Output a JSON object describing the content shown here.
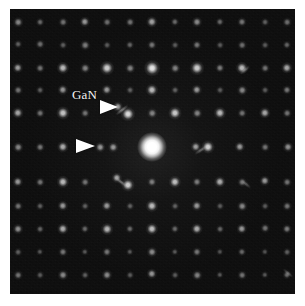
{
  "figure": {
    "type": "electron-diffraction-pattern",
    "modality": "TEM selected-area electron diffraction",
    "panel": {
      "x": 10,
      "y": 9,
      "width": 285,
      "height": 285,
      "background_color": "#0a0a0a",
      "page_background_color": "#ffffff"
    },
    "annotations": {
      "label_text": "GaN",
      "label_color": "#f4f4f4",
      "label_x": 72,
      "label_y": 88,
      "label_font_size": 13,
      "arrow_color": "#ffffff",
      "arrows": [
        {
          "name": "upper-arrowhead",
          "x": 100,
          "y": 100,
          "width": 18,
          "half_height": 7,
          "direction": "right"
        },
        {
          "name": "lower-arrowhead",
          "x": 76,
          "y": 139,
          "width": 19,
          "half_height": 7,
          "direction": "right"
        }
      ]
    },
    "direct_beam": {
      "name": "central-transmitted-beam",
      "cx": 152,
      "cy": 147,
      "diameter": 30,
      "intensity": 1.0
    },
    "lattice": {
      "description": "square-ish reciprocal lattice of diffraction maxima with superlattice satellites",
      "a_spacing_px": 22.5,
      "b_spacing_px": 24.5,
      "origin_x": 152,
      "origin_y": 147
    },
    "spots": [
      {
        "cx": 18,
        "cy": 22,
        "r": 2.4,
        "i": 0.5
      },
      {
        "cx": 40,
        "cy": 22,
        "r": 2.0,
        "i": 0.38
      },
      {
        "cx": 63,
        "cy": 22,
        "r": 2.2,
        "i": 0.42
      },
      {
        "cx": 85,
        "cy": 22,
        "r": 2.6,
        "i": 0.58
      },
      {
        "cx": 107,
        "cy": 22,
        "r": 2.2,
        "i": 0.4
      },
      {
        "cx": 130,
        "cy": 22,
        "r": 2.2,
        "i": 0.42
      },
      {
        "cx": 152,
        "cy": 22,
        "r": 2.8,
        "i": 0.62
      },
      {
        "cx": 175,
        "cy": 22,
        "r": 2.1,
        "i": 0.38
      },
      {
        "cx": 197,
        "cy": 22,
        "r": 2.5,
        "i": 0.52
      },
      {
        "cx": 220,
        "cy": 22,
        "r": 2.1,
        "i": 0.38
      },
      {
        "cx": 242,
        "cy": 22,
        "r": 2.3,
        "i": 0.44
      },
      {
        "cx": 265,
        "cy": 22,
        "r": 2.0,
        "i": 0.34
      },
      {
        "cx": 287,
        "cy": 22,
        "r": 2.2,
        "i": 0.4
      },
      {
        "cx": 18,
        "cy": 44,
        "r": 2.0,
        "i": 0.34
      },
      {
        "cx": 40,
        "cy": 44,
        "r": 2.2,
        "i": 0.4
      },
      {
        "cx": 63,
        "cy": 45,
        "r": 2.0,
        "i": 0.34
      },
      {
        "cx": 85,
        "cy": 45,
        "r": 2.4,
        "i": 0.46
      },
      {
        "cx": 107,
        "cy": 45,
        "r": 2.0,
        "i": 0.32
      },
      {
        "cx": 130,
        "cy": 45,
        "r": 2.1,
        "i": 0.36
      },
      {
        "cx": 152,
        "cy": 45,
        "r": 2.3,
        "i": 0.44
      },
      {
        "cx": 175,
        "cy": 45,
        "r": 2.0,
        "i": 0.32
      },
      {
        "cx": 197,
        "cy": 45,
        "r": 2.3,
        "i": 0.44
      },
      {
        "cx": 220,
        "cy": 45,
        "r": 2.0,
        "i": 0.32
      },
      {
        "cx": 242,
        "cy": 45,
        "r": 2.2,
        "i": 0.4
      },
      {
        "cx": 265,
        "cy": 45,
        "r": 2.0,
        "i": 0.32
      },
      {
        "cx": 287,
        "cy": 45,
        "r": 2.1,
        "i": 0.36
      },
      {
        "cx": 18,
        "cy": 68,
        "r": 2.6,
        "i": 0.6
      },
      {
        "cx": 40,
        "cy": 68,
        "r": 2.2,
        "i": 0.42
      },
      {
        "cx": 63,
        "cy": 68,
        "r": 3.0,
        "i": 0.72
      },
      {
        "cx": 85,
        "cy": 68,
        "r": 2.4,
        "i": 0.48
      },
      {
        "cx": 107,
        "cy": 68,
        "r": 3.4,
        "i": 0.8
      },
      {
        "cx": 130,
        "cy": 68,
        "r": 2.4,
        "i": 0.48
      },
      {
        "cx": 152,
        "cy": 68,
        "r": 3.8,
        "i": 0.9
      },
      {
        "cx": 175,
        "cy": 68,
        "r": 2.4,
        "i": 0.48
      },
      {
        "cx": 197,
        "cy": 68,
        "r": 3.4,
        "i": 0.8
      },
      {
        "cx": 220,
        "cy": 68,
        "r": 2.3,
        "i": 0.46
      },
      {
        "cx": 242,
        "cy": 68,
        "r": 3.0,
        "i": 0.72
      },
      {
        "cx": 265,
        "cy": 68,
        "r": 2.2,
        "i": 0.42
      },
      {
        "cx": 287,
        "cy": 68,
        "r": 2.8,
        "i": 0.64
      },
      {
        "cx": 18,
        "cy": 90,
        "r": 2.2,
        "i": 0.42
      },
      {
        "cx": 40,
        "cy": 90,
        "r": 2.0,
        "i": 0.34
      },
      {
        "cx": 63,
        "cy": 90,
        "r": 2.6,
        "i": 0.56
      },
      {
        "cx": 107,
        "cy": 90,
        "r": 2.6,
        "i": 0.58
      },
      {
        "cx": 130,
        "cy": 90,
        "r": 2.0,
        "i": 0.34
      },
      {
        "cx": 152,
        "cy": 90,
        "r": 3.0,
        "i": 0.72
      },
      {
        "cx": 175,
        "cy": 90,
        "r": 2.0,
        "i": 0.34
      },
      {
        "cx": 197,
        "cy": 90,
        "r": 2.6,
        "i": 0.58
      },
      {
        "cx": 220,
        "cy": 90,
        "r": 2.0,
        "i": 0.32
      },
      {
        "cx": 242,
        "cy": 90,
        "r": 2.4,
        "i": 0.5
      },
      {
        "cx": 265,
        "cy": 90,
        "r": 2.0,
        "i": 0.32
      },
      {
        "cx": 287,
        "cy": 90,
        "r": 2.3,
        "i": 0.44
      },
      {
        "cx": 18,
        "cy": 113,
        "r": 2.8,
        "i": 0.64
      },
      {
        "cx": 40,
        "cy": 113,
        "r": 2.2,
        "i": 0.42
      },
      {
        "cx": 63,
        "cy": 113,
        "r": 3.2,
        "i": 0.76
      },
      {
        "cx": 85,
        "cy": 113,
        "r": 2.2,
        "i": 0.42
      },
      {
        "cx": 118,
        "cy": 107,
        "r": 2.6,
        "i": 0.62
      },
      {
        "cx": 128,
        "cy": 114,
        "r": 3.4,
        "i": 0.86
      },
      {
        "cx": 152,
        "cy": 113,
        "r": 2.4,
        "i": 0.48
      },
      {
        "cx": 175,
        "cy": 113,
        "r": 3.2,
        "i": 0.78
      },
      {
        "cx": 197,
        "cy": 113,
        "r": 2.4,
        "i": 0.48
      },
      {
        "cx": 220,
        "cy": 113,
        "r": 3.0,
        "i": 0.72
      },
      {
        "cx": 242,
        "cy": 113,
        "r": 2.2,
        "i": 0.42
      },
      {
        "cx": 265,
        "cy": 113,
        "r": 2.8,
        "i": 0.64
      },
      {
        "cx": 287,
        "cy": 113,
        "r": 2.2,
        "i": 0.42
      },
      {
        "cx": 18,
        "cy": 147,
        "r": 2.4,
        "i": 0.5
      },
      {
        "cx": 40,
        "cy": 147,
        "r": 2.2,
        "i": 0.44
      },
      {
        "cx": 63,
        "cy": 147,
        "r": 2.8,
        "i": 0.66
      },
      {
        "cx": 100,
        "cy": 147,
        "r": 2.4,
        "i": 0.56
      },
      {
        "cx": 113,
        "cy": 147,
        "r": 2.4,
        "i": 0.56
      },
      {
        "cx": 196,
        "cy": 147,
        "r": 2.6,
        "i": 0.6
      },
      {
        "cx": 208,
        "cy": 147,
        "r": 3.2,
        "i": 0.82
      },
      {
        "cx": 240,
        "cy": 147,
        "r": 2.6,
        "i": 0.58
      },
      {
        "cx": 265,
        "cy": 147,
        "r": 2.2,
        "i": 0.42
      },
      {
        "cx": 288,
        "cy": 147,
        "r": 2.5,
        "i": 0.54
      },
      {
        "cx": 18,
        "cy": 182,
        "r": 2.6,
        "i": 0.58
      },
      {
        "cx": 40,
        "cy": 182,
        "r": 2.2,
        "i": 0.42
      },
      {
        "cx": 63,
        "cy": 182,
        "r": 3.0,
        "i": 0.72
      },
      {
        "cx": 85,
        "cy": 182,
        "r": 2.2,
        "i": 0.42
      },
      {
        "cx": 117,
        "cy": 178,
        "r": 2.6,
        "i": 0.62
      },
      {
        "cx": 128,
        "cy": 185,
        "r": 3.2,
        "i": 0.8
      },
      {
        "cx": 152,
        "cy": 182,
        "r": 2.3,
        "i": 0.46
      },
      {
        "cx": 175,
        "cy": 182,
        "r": 3.0,
        "i": 0.74
      },
      {
        "cx": 197,
        "cy": 182,
        "r": 2.3,
        "i": 0.46
      },
      {
        "cx": 220,
        "cy": 182,
        "r": 2.8,
        "i": 0.66
      },
      {
        "cx": 242,
        "cy": 182,
        "r": 2.2,
        "i": 0.42
      },
      {
        "cx": 265,
        "cy": 181,
        "r": 2.6,
        "i": 0.58
      },
      {
        "cx": 287,
        "cy": 182,
        "r": 2.2,
        "i": 0.42
      },
      {
        "cx": 18,
        "cy": 206,
        "r": 2.2,
        "i": 0.42
      },
      {
        "cx": 40,
        "cy": 206,
        "r": 2.0,
        "i": 0.34
      },
      {
        "cx": 63,
        "cy": 206,
        "r": 2.6,
        "i": 0.58
      },
      {
        "cx": 85,
        "cy": 206,
        "r": 2.0,
        "i": 0.34
      },
      {
        "cx": 107,
        "cy": 206,
        "r": 2.6,
        "i": 0.58
      },
      {
        "cx": 130,
        "cy": 206,
        "r": 2.0,
        "i": 0.34
      },
      {
        "cx": 152,
        "cy": 206,
        "r": 3.0,
        "i": 0.72
      },
      {
        "cx": 175,
        "cy": 206,
        "r": 2.0,
        "i": 0.34
      },
      {
        "cx": 197,
        "cy": 206,
        "r": 2.6,
        "i": 0.58
      },
      {
        "cx": 220,
        "cy": 206,
        "r": 2.0,
        "i": 0.32
      },
      {
        "cx": 242,
        "cy": 206,
        "r": 2.4,
        "i": 0.5
      },
      {
        "cx": 265,
        "cy": 206,
        "r": 2.0,
        "i": 0.32
      },
      {
        "cx": 287,
        "cy": 206,
        "r": 2.2,
        "i": 0.42
      },
      {
        "cx": 18,
        "cy": 229,
        "r": 2.5,
        "i": 0.54
      },
      {
        "cx": 40,
        "cy": 229,
        "r": 2.0,
        "i": 0.36
      },
      {
        "cx": 63,
        "cy": 229,
        "r": 2.8,
        "i": 0.66
      },
      {
        "cx": 85,
        "cy": 229,
        "r": 2.1,
        "i": 0.38
      },
      {
        "cx": 107,
        "cy": 229,
        "r": 2.9,
        "i": 0.7
      },
      {
        "cx": 130,
        "cy": 229,
        "r": 2.1,
        "i": 0.38
      },
      {
        "cx": 152,
        "cy": 229,
        "r": 3.0,
        "i": 0.74
      },
      {
        "cx": 175,
        "cy": 229,
        "r": 2.1,
        "i": 0.38
      },
      {
        "cx": 197,
        "cy": 229,
        "r": 2.8,
        "i": 0.66
      },
      {
        "cx": 220,
        "cy": 229,
        "r": 2.0,
        "i": 0.36
      },
      {
        "cx": 242,
        "cy": 229,
        "r": 2.6,
        "i": 0.58
      },
      {
        "cx": 265,
        "cy": 228,
        "r": 2.2,
        "i": 0.42
      },
      {
        "cx": 287,
        "cy": 229,
        "r": 2.3,
        "i": 0.46
      },
      {
        "cx": 18,
        "cy": 252,
        "r": 2.0,
        "i": 0.34
      },
      {
        "cx": 40,
        "cy": 252,
        "r": 1.9,
        "i": 0.3
      },
      {
        "cx": 63,
        "cy": 252,
        "r": 2.3,
        "i": 0.44
      },
      {
        "cx": 85,
        "cy": 252,
        "r": 1.9,
        "i": 0.3
      },
      {
        "cx": 107,
        "cy": 252,
        "r": 2.3,
        "i": 0.44
      },
      {
        "cx": 130,
        "cy": 252,
        "r": 1.9,
        "i": 0.3
      },
      {
        "cx": 152,
        "cy": 252,
        "r": 2.5,
        "i": 0.52
      },
      {
        "cx": 175,
        "cy": 252,
        "r": 1.9,
        "i": 0.3
      },
      {
        "cx": 197,
        "cy": 252,
        "r": 2.3,
        "i": 0.44
      },
      {
        "cx": 220,
        "cy": 252,
        "r": 1.9,
        "i": 0.28
      },
      {
        "cx": 242,
        "cy": 252,
        "r": 2.1,
        "i": 0.38
      },
      {
        "cx": 265,
        "cy": 252,
        "r": 1.9,
        "i": 0.28
      },
      {
        "cx": 287,
        "cy": 252,
        "r": 2.0,
        "i": 0.34
      },
      {
        "cx": 18,
        "cy": 275,
        "r": 2.2,
        "i": 0.42
      },
      {
        "cx": 40,
        "cy": 275,
        "r": 2.0,
        "i": 0.32
      },
      {
        "cx": 63,
        "cy": 275,
        "r": 2.5,
        "i": 0.52
      },
      {
        "cx": 85,
        "cy": 275,
        "r": 2.0,
        "i": 0.34
      },
      {
        "cx": 107,
        "cy": 275,
        "r": 2.5,
        "i": 0.52
      },
      {
        "cx": 130,
        "cy": 275,
        "r": 2.0,
        "i": 0.32
      },
      {
        "cx": 152,
        "cy": 274,
        "r": 2.6,
        "i": 0.56
      },
      {
        "cx": 175,
        "cy": 275,
        "r": 2.0,
        "i": 0.32
      },
      {
        "cx": 197,
        "cy": 275,
        "r": 2.4,
        "i": 0.48
      },
      {
        "cx": 220,
        "cy": 275,
        "r": 1.9,
        "i": 0.3
      },
      {
        "cx": 242,
        "cy": 275,
        "r": 2.2,
        "i": 0.42
      },
      {
        "cx": 265,
        "cy": 275,
        "r": 1.9,
        "i": 0.3
      },
      {
        "cx": 287,
        "cy": 275,
        "r": 2.1,
        "i": 0.38
      }
    ],
    "streaks": [
      {
        "name": "streak-upper-left",
        "cx": 122,
        "cy": 110,
        "len": 16,
        "thick": 4,
        "angle": -38,
        "i": 0.55
      },
      {
        "name": "streak-lower-left",
        "cx": 121,
        "cy": 182,
        "len": 16,
        "thick": 4,
        "angle": 38,
        "i": 0.5
      },
      {
        "name": "streak-right-mid",
        "cx": 201,
        "cy": 150,
        "len": 16,
        "thick": 4,
        "angle": -34,
        "i": 0.45
      },
      {
        "name": "streak-upper-right",
        "cx": 245,
        "cy": 70,
        "len": 13,
        "thick": 4,
        "angle": -40,
        "i": 0.4
      },
      {
        "name": "streak-lower-right",
        "cx": 246,
        "cy": 184,
        "len": 13,
        "thick": 4,
        "angle": 40,
        "i": 0.38
      },
      {
        "name": "streak-far-right",
        "cx": 288,
        "cy": 273,
        "len": 13,
        "thick": 4,
        "angle": 40,
        "i": 0.36
      }
    ]
  }
}
